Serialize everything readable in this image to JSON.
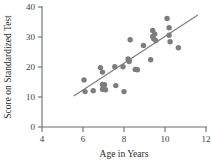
{
  "chart_data": {
    "type": "scatter",
    "title": "",
    "xlabel": "Age in Years",
    "ylabel": "Score on Standardized Test",
    "xlim": [
      4,
      12
    ],
    "ylim": [
      0,
      40
    ],
    "xticks": [
      4,
      6,
      8,
      10,
      12
    ],
    "yticks": [
      0,
      10,
      20,
      30,
      40
    ],
    "xtick_labels": [
      "4",
      "6",
      "8",
      "10",
      "12"
    ],
    "ytick_labels": [
      "0",
      "10",
      "20",
      "30",
      "40"
    ],
    "grid": false,
    "legend": null,
    "marker_color": "#7d7d7d",
    "line_color": "#7d7d7d",
    "axis_color": "#6b6b6b",
    "points": [
      {
        "x": 6.05,
        "y": 15.7
      },
      {
        "x": 6.1,
        "y": 11.8
      },
      {
        "x": 6.5,
        "y": 12.1
      },
      {
        "x": 6.85,
        "y": 19.8
      },
      {
        "x": 6.95,
        "y": 18.3
      },
      {
        "x": 6.95,
        "y": 14.2
      },
      {
        "x": 7.05,
        "y": 14.1
      },
      {
        "x": 6.95,
        "y": 12.6
      },
      {
        "x": 7.1,
        "y": 12.4
      },
      {
        "x": 7.55,
        "y": 20.1
      },
      {
        "x": 7.6,
        "y": 13.8
      },
      {
        "x": 7.95,
        "y": 20.1
      },
      {
        "x": 8.0,
        "y": 11.8
      },
      {
        "x": 8.2,
        "y": 22.7
      },
      {
        "x": 8.25,
        "y": 22.3
      },
      {
        "x": 8.25,
        "y": 21.8
      },
      {
        "x": 8.3,
        "y": 29.1
      },
      {
        "x": 8.55,
        "y": 19.2
      },
      {
        "x": 8.65,
        "y": 19.1
      },
      {
        "x": 8.95,
        "y": 27.2
      },
      {
        "x": 9.3,
        "y": 22.4
      },
      {
        "x": 9.4,
        "y": 32.2
      },
      {
        "x": 9.4,
        "y": 30.2
      },
      {
        "x": 9.45,
        "y": 29.4
      },
      {
        "x": 9.5,
        "y": 31.0
      },
      {
        "x": 9.55,
        "y": 28.8
      },
      {
        "x": 10.1,
        "y": 36.2
      },
      {
        "x": 10.2,
        "y": 33.1
      },
      {
        "x": 10.2,
        "y": 30.6
      },
      {
        "x": 10.25,
        "y": 28.4
      },
      {
        "x": 10.65,
        "y": 26.4
      }
    ],
    "fit_line": {
      "x_start": 5.55,
      "y_start": 10.3,
      "x_end": 11.6,
      "y_end": 37.3
    }
  }
}
